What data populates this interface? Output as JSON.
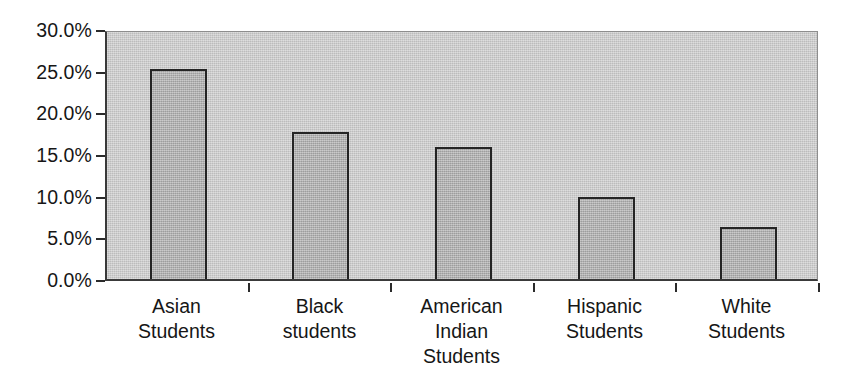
{
  "chart_data": {
    "type": "bar",
    "title": "",
    "subtitle": "",
    "xlabel": "",
    "ylabel": "",
    "categories": [
      "Asian Students",
      "Black students",
      "American Indian Students",
      "Hispanic Students",
      "White Students"
    ],
    "category_lines": [
      [
        "Asian",
        "Students"
      ],
      [
        "Black",
        "students"
      ],
      [
        "American",
        "Indian",
        "Students"
      ],
      [
        "Hispanic",
        "Students"
      ],
      [
        "White",
        "Students"
      ]
    ],
    "values": [
      25.2,
      17.6,
      15.8,
      9.8,
      6.2
    ],
    "value_unit": "%",
    "ylim": [
      0,
      30
    ],
    "ytick_values": [
      0,
      5,
      10,
      15,
      20,
      25,
      30
    ],
    "ytick_labels": [
      "0.0%",
      "5.0%",
      "10.0%",
      "15.0%",
      "20.0%",
      "25.0%",
      "30.0%"
    ],
    "grid": false,
    "legend": null,
    "legend_position": "none",
    "colors": {
      "plot_background": "#c9c9c9",
      "bar_fill": "#b2b2b2",
      "bar_border": "#242424",
      "axis": "#2b2b2b",
      "text": "#161616",
      "page_background": "#ffffff"
    }
  }
}
